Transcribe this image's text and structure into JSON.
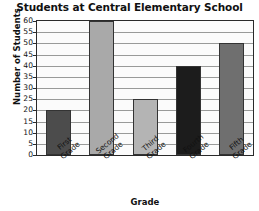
{
  "chart_data": {
    "type": "bar",
    "title": "Students at Central Elementary School",
    "xlabel": "Grade",
    "ylabel": "Number of Students",
    "categories": [
      "First Grade",
      "Second Grade",
      "Third Grade",
      "Fourth Grade",
      "Fifth Grade"
    ],
    "category_lines": [
      [
        "First",
        "Grade"
      ],
      [
        "Second",
        "Grade"
      ],
      [
        "Third",
        "Grade"
      ],
      [
        "Fourth",
        "Grade"
      ],
      [
        "Fifth",
        "Grade"
      ]
    ],
    "values": [
      20,
      60,
      25,
      40,
      50
    ],
    "ylim": [
      0,
      60
    ],
    "ytick_values": [
      0,
      5,
      10,
      15,
      20,
      25,
      30,
      35,
      40,
      45,
      50,
      55,
      60
    ],
    "ytick_labels": [
      "0",
      "5",
      "10",
      "15",
      "20",
      "25",
      "30",
      "35",
      "40",
      "45",
      "50",
      "55",
      "60"
    ],
    "grid": true,
    "legend": "none",
    "bar_colors": [
      "#4c4c4c",
      "#a9a9a9",
      "#b4b4b4",
      "#1c1c1c",
      "#6f6f6f"
    ],
    "plot_background": "#fbfbfb",
    "grid_color": "#999a99",
    "axis_color": "#2a2a2a",
    "text_color": "#111111"
  }
}
